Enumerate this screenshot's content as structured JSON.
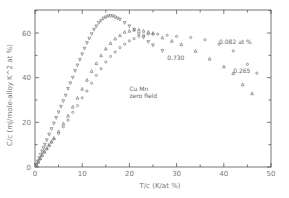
{
  "chart_data": {
    "type": "scatter",
    "title": "",
    "xlabel": "T/c  (K/at %)",
    "ylabel": "C/c  (mJ/mole-alloy K^2 at %)",
    "xlim": [
      0,
      50
    ],
    "ylim": [
      0,
      70
    ],
    "xticks": [
      0,
      10,
      20,
      30,
      40,
      50
    ],
    "yticks": [
      0,
      20,
      40,
      60
    ],
    "grid": false,
    "annotations": [
      {
        "text": "Cu Mn",
        "x": 20,
        "y": 34
      },
      {
        "text": "zero field",
        "x": 20,
        "y": 31
      },
      {
        "text": "0.082 at %",
        "x": 39,
        "y": 55
      },
      {
        "text": "0.730",
        "x": 28,
        "y": 48
      },
      {
        "text": "0.265",
        "x": 42,
        "y": 42
      }
    ],
    "series": [
      {
        "name": "0.730",
        "marker": "triangle-down",
        "x": [
          0.3,
          0.6,
          0.9,
          1.2,
          1.5,
          1.8,
          2.1,
          2.5,
          3,
          3.5,
          4,
          4.5,
          5,
          5.5,
          6,
          6.5,
          7,
          7.5,
          8,
          8.5,
          9,
          9.5,
          10,
          10.5,
          11,
          11.5,
          12,
          12.5,
          13,
          13.5,
          14,
          14.5,
          15,
          15.5,
          16,
          16.5,
          17,
          17.5,
          18,
          19,
          20,
          21,
          22,
          23,
          24,
          25,
          27
        ],
        "y": [
          1,
          2.5,
          4,
          5.5,
          7,
          8.5,
          10,
          12,
          14.5,
          17,
          19.5,
          22,
          24.5,
          27,
          29.5,
          32,
          35,
          37.5,
          40,
          43,
          45.5,
          48,
          50.5,
          53,
          55.5,
          57.5,
          59.5,
          61.5,
          63,
          64.5,
          65.5,
          66.5,
          67,
          67.5,
          67.5,
          67.5,
          67,
          66.5,
          66,
          64.5,
          63,
          61.5,
          59.5,
          58,
          56,
          54.5,
          52
        ]
      },
      {
        "name": "0.265",
        "marker": "triangle-up",
        "x": [
          0.3,
          0.7,
          1.1,
          1.5,
          2,
          2.5,
          3,
          3.5,
          4,
          5,
          6,
          7,
          8,
          9,
          10,
          11,
          12,
          13,
          14,
          15,
          16,
          17,
          18,
          19,
          20,
          21,
          22,
          23,
          24,
          25,
          27,
          29,
          31,
          34,
          37,
          40,
          42,
          44,
          46
        ],
        "y": [
          1,
          2.5,
          4,
          5.5,
          7,
          8.5,
          10,
          11.5,
          13,
          16,
          19.5,
          23,
          27,
          31,
          35,
          39,
          43,
          46.5,
          50,
          53,
          55.5,
          57.5,
          59,
          60.5,
          61,
          61.5,
          61.5,
          61,
          60.5,
          60,
          58,
          56.5,
          55,
          52,
          48.5,
          45,
          42,
          37,
          33
        ]
      },
      {
        "name": "0.082",
        "marker": "circle",
        "x": [
          0.3,
          0.7,
          1.1,
          1.5,
          2,
          2.5,
          3,
          3.5,
          4,
          5,
          6,
          7,
          8,
          9,
          10,
          11,
          12,
          13,
          14,
          15,
          16,
          17,
          18,
          19,
          20,
          21,
          22,
          23,
          24,
          25,
          26,
          28,
          30,
          33,
          36,
          39,
          42,
          45,
          47
        ],
        "y": [
          1,
          2,
          3.5,
          5,
          6.5,
          8,
          9.5,
          11,
          12.5,
          15,
          18,
          21,
          24.5,
          27.5,
          31,
          34,
          37.5,
          41,
          44,
          47,
          49.5,
          51.5,
          53.5,
          55,
          56.5,
          57.5,
          58.5,
          59,
          59.5,
          59.5,
          59.5,
          59,
          58.5,
          58,
          57,
          55,
          52,
          46,
          42
        ]
      }
    ]
  }
}
